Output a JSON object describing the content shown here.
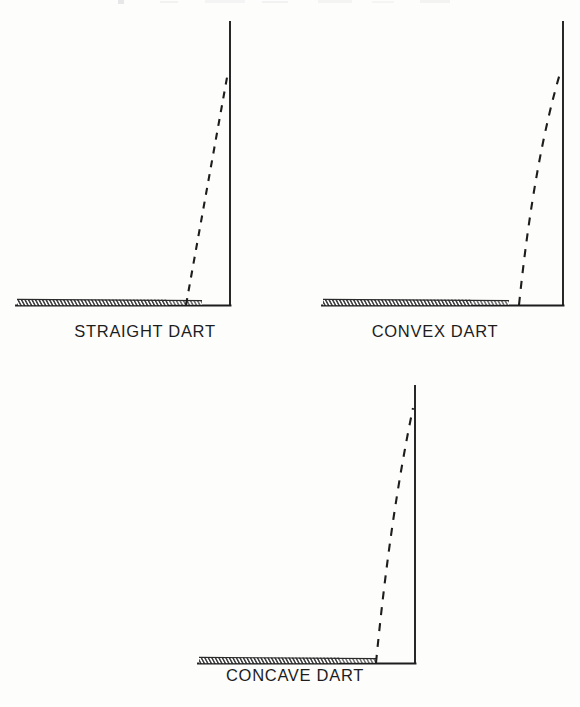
{
  "figure": {
    "background_color": "#fdfdfc",
    "ink_color": "#1d1d1d",
    "hatch_color": "#3a3a3a",
    "panels": [
      {
        "id": "straight-dart",
        "caption": "STRAIGHT DART",
        "dart_type": "straight",
        "curvature": 0,
        "description": "Dart leg drawn as a straight dashed line from the baseline up to the vertical fold line."
      },
      {
        "id": "convex-dart",
        "caption": "CONVEX DART",
        "dart_type": "convex",
        "curvature": 1,
        "description": "Dart leg drawn as a dashed line bowing outward away from the vertical fold line."
      },
      {
        "id": "concave-dart",
        "caption": "CONCAVE DART",
        "dart_type": "concave",
        "curvature": -1,
        "description": "Dart leg drawn as a dashed line bowing inward toward the vertical fold line."
      }
    ],
    "legend": {
      "solid_line_meaning": "garment edge / fold line",
      "dashed_line_meaning": "dart stitching line",
      "hatched_band_meaning": "fabric edge / seam allowance"
    }
  }
}
